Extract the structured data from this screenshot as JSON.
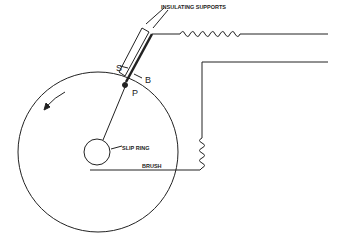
{
  "diagram": {
    "labels": {
      "insulating_supports": "INSULATING SUPPORTS",
      "s": "S",
      "b": "B",
      "p": "P",
      "slip_ring": "SLIP RING",
      "brush": "BRUSH"
    },
    "rotation_arrow": "counter-clockwise",
    "colors": {
      "line": "#222222",
      "background": "#ffffff"
    }
  }
}
